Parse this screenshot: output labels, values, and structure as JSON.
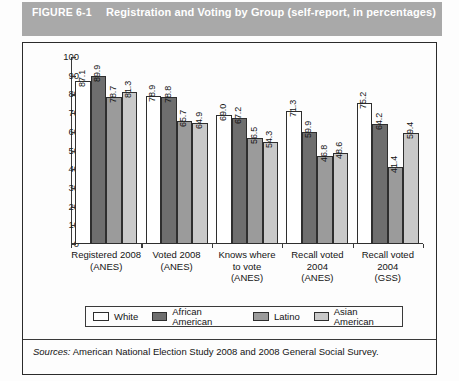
{
  "header": {
    "figure_number": "FIGURE 6-1",
    "title": "Registration and Voting by Group (self-report, in percentages)",
    "bar_color": "#a9a9a9",
    "text_color": "#ffffff"
  },
  "source": {
    "label": "Sources:",
    "text": "American National Election Study 2008 and 2008 General Social Survey."
  },
  "chart_data": {
    "type": "bar",
    "title": "Registration and Voting by Group (self-report, in percentages)",
    "xlabel": "",
    "ylabel": "",
    "ylim": [
      0,
      100
    ],
    "yticks": [
      0,
      10,
      20,
      30,
      40,
      50,
      60,
      70,
      80,
      90,
      100
    ],
    "grid": false,
    "legend_position": "bottom",
    "categories": [
      "Registered 2008 (ANES)",
      "Voted 2008 (ANES)",
      "Knows where to vote (ANES)",
      "Recall voted 2004 (ANES)",
      "Recall voted 2004 (GSS)"
    ],
    "category_lines": [
      [
        "Registered 2008",
        "(ANES)"
      ],
      [
        "Voted 2008",
        "(ANES)"
      ],
      [
        "Knows where",
        "to vote",
        "(ANES)"
      ],
      [
        "Recall voted",
        "2004",
        "(ANES)"
      ],
      [
        "Recall voted",
        "2004",
        "(GSS)"
      ]
    ],
    "series": [
      {
        "name": "White",
        "color": "#ffffff",
        "values": [
          87.1,
          78.9,
          69.0,
          71.3,
          75.2
        ],
        "labels": [
          "87.1",
          "78.9",
          "69.0",
          "71.3",
          "75.2"
        ]
      },
      {
        "name": "African American",
        "color": "#6e6e6e",
        "values": [
          89.9,
          78.8,
          67.2,
          59.9,
          64.2
        ],
        "labels": [
          "89.9",
          "78.8",
          "67.2",
          "59.9",
          "64.2"
        ]
      },
      {
        "name": "Latino",
        "color": "#9b9b9b",
        "values": [
          78.7,
          65.7,
          56.5,
          46.8,
          41.4
        ],
        "labels": [
          "78.7",
          "65.7",
          "56.5",
          "46.8",
          "41.4"
        ]
      },
      {
        "name": "Asian American",
        "color": "#c9c9c9",
        "values": [
          81.3,
          64.9,
          54.3,
          48.6,
          59.4
        ],
        "labels": [
          "81.3",
          "64.9",
          "54.3",
          "48.6",
          "59.4"
        ]
      }
    ]
  }
}
